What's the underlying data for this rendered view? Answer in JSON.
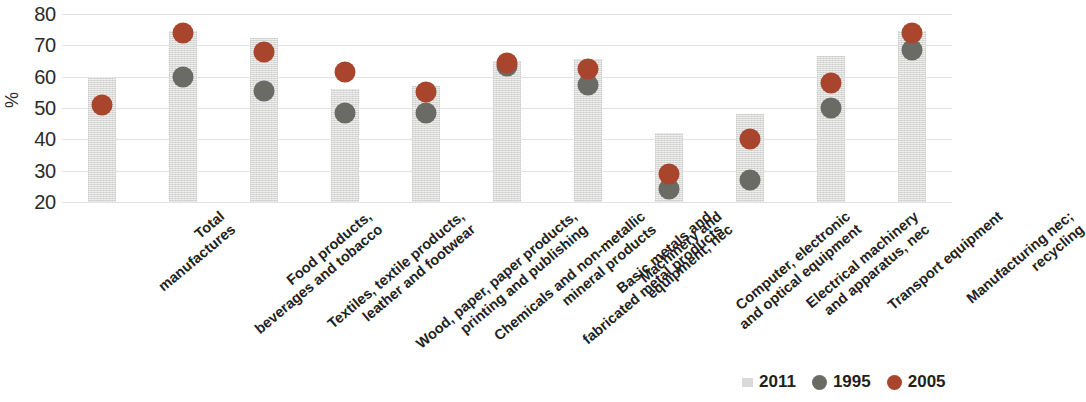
{
  "chart_data": {
    "type": "bar",
    "title": "",
    "subtitle": "",
    "xlabel": "",
    "ylabel": "%",
    "ylim": [
      20,
      80
    ],
    "yticks": [
      20,
      30,
      40,
      50,
      60,
      70,
      80
    ],
    "grid": true,
    "legend_position": "bottom-right",
    "categories": [
      "Total manufactures",
      "Food products, beverages and tobacco",
      "Textiles, textile products, leather and footwear",
      "Wood, paper, paper products, printing and publishing",
      "Chemicals and non-metallic mineral products",
      "Basic metals and fabricated metal products",
      "Machinery and equipment, nec",
      "Computer, electronic and optical equipment",
      "Electrical machinery and apparatus, nec",
      "Transport equipment",
      "Manufacturing nec; recycling"
    ],
    "category_lines": [
      [
        "Total",
        "manufactures"
      ],
      [
        "Food products,",
        "beverages and tobacco"
      ],
      [
        "Textiles, textile products,",
        "leather and footwear"
      ],
      [
        "Wood, paper, paper products,",
        "printing and publishing"
      ],
      [
        "Chemicals and non-metallic",
        "mineral products"
      ],
      [
        "Basic metals and",
        "fabricated metal products"
      ],
      [
        "Machinery and",
        "equipment, nec"
      ],
      [
        "Computer, electronic",
        "and optical equipment"
      ],
      [
        "Electrical machinery",
        "and apparatus, nec"
      ],
      [
        "Transport equipment",
        ""
      ],
      [
        "Manufacturing nec;",
        "recycling"
      ]
    ],
    "series": [
      {
        "name": "2011",
        "type": "bar",
        "color": "#d9d9d7",
        "values": [
          60.0,
          74.5,
          72.5,
          56.0,
          57.0,
          65.0,
          65.5,
          42.0,
          48.0,
          66.5,
          74.5
        ]
      },
      {
        "name": "1995",
        "type": "marker",
        "color": "#6b6b66",
        "values": [
          null,
          60.0,
          55.5,
          48.5,
          48.5,
          63.5,
          57.5,
          24.0,
          27.0,
          50.0,
          68.5
        ]
      },
      {
        "name": "2005",
        "type": "marker",
        "color": "#a8452c",
        "values": [
          51.0,
          74.0,
          68.0,
          61.5,
          55.0,
          64.5,
          62.5,
          29.0,
          40.0,
          58.0,
          74.0
        ]
      }
    ]
  },
  "legend": {
    "items": [
      {
        "label": "2011",
        "marker": "square-swatch",
        "color": "#d9d9d7"
      },
      {
        "label": "1995",
        "marker": "circle-swatch",
        "color": "#6b6b66"
      },
      {
        "label": "2005",
        "marker": "circle-swatch",
        "color": "#a8452c"
      }
    ]
  }
}
